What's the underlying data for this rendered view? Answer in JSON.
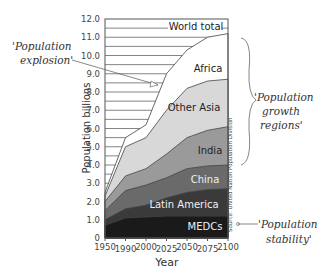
{
  "chart_data": {
    "type": "area",
    "stacked": true,
    "title": "",
    "xlabel": "Year",
    "ylabel": "Population billions",
    "ylim": [
      0,
      12
    ],
    "yticks": [
      "0",
      "1.0",
      "2.0",
      "3.0",
      "4.0",
      "5.0",
      "6.0",
      "7.0",
      "8.0",
      "9.0",
      "10.0",
      "11.0",
      "12.0"
    ],
    "x": [
      1950,
      1990,
      2000,
      2025,
      2050,
      2075,
      2100
    ],
    "xticks": [
      "1950",
      "1990",
      "2000",
      "2025",
      "2050",
      "2075",
      "2100"
    ],
    "grid": "horizontal lines every 0.5 in empty region",
    "series": [
      {
        "name": "MEDCs",
        "cumulative": [
          0.7,
          1.1,
          1.15,
          1.2,
          1.2,
          1.2,
          1.2
        ],
        "color": "#1a1a1a"
      },
      {
        "name": "Latin America",
        "cumulative": [
          1.0,
          1.6,
          1.8,
          2.2,
          2.5,
          2.65,
          2.7
        ],
        "color": "#3a3a3a"
      },
      {
        "name": "China",
        "cumulative": [
          1.5,
          2.6,
          2.9,
          3.3,
          3.8,
          3.95,
          4.0
        ],
        "color": "#6a6a6a"
      },
      {
        "name": "India",
        "cumulative": [
          2.0,
          3.4,
          3.8,
          4.6,
          5.5,
          5.9,
          6.1
        ],
        "color": "#9a9a9a"
      },
      {
        "name": "Other Asia",
        "cumulative": [
          2.3,
          5.0,
          5.5,
          7.0,
          8.2,
          8.6,
          8.7
        ],
        "color": "#d8d8d8"
      },
      {
        "name": "Africa",
        "cumulative": [
          2.5,
          5.5,
          6.2,
          9.0,
          10.3,
          11.0,
          11.2
        ],
        "color": "#ffffff"
      }
    ],
    "annotations": [
      {
        "text": "World total",
        "position": "top"
      },
      {
        "text": "'Population explosion'",
        "position": "left, arrow to ~2025"
      },
      {
        "text": "'Population growth regions'",
        "position": "right, brace over Africa to India"
      },
      {
        "text": "'Population stability'",
        "position": "right, arrow to MEDCs"
      },
      {
        "text": "Source: United Nation Population Division",
        "position": "vertical at right edge of plot"
      }
    ]
  },
  "labels": {
    "world_total": "World total",
    "africa": "Africa",
    "other_asia": "Other Asia",
    "india": "India",
    "china": "China",
    "latin_america": "Latin America",
    "medcs": "MEDCs",
    "explosion_1": "'Population",
    "explosion_2": "explosion'",
    "growth_1": "'Population",
    "growth_2": "growth",
    "growth_3": "regions'",
    "stability_1": "'Population",
    "stability_2": "stability'",
    "source": "Source: United Nation Population Division",
    "ylabel": "Population billions",
    "xlabel": "Year"
  },
  "yticks": [
    "0",
    "1.0",
    "2.0",
    "3.0",
    "4.0",
    "5.0",
    "6.0",
    "7.0",
    "8.0",
    "9.0",
    "10.0",
    "11.0",
    "12.0"
  ],
  "xticks": [
    "1950",
    "1990",
    "2000",
    "2025",
    "2050",
    "2075",
    "2100"
  ]
}
